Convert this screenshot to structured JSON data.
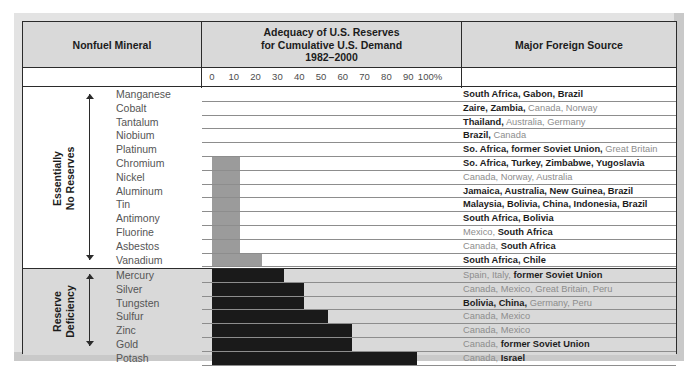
{
  "header": {
    "col_mineral": "Nonfuel Mineral",
    "col_adequacy_line1": "Adequacy of U.S. Reserves",
    "col_adequacy_line2": "for Cumulative U.S. Demand",
    "col_adequacy_line3": "1982–2000",
    "col_source": "Major Foreign Source"
  },
  "axis": {
    "ticks": [
      "0",
      "10",
      "20",
      "30",
      "40",
      "50",
      "60",
      "70",
      "80",
      "90",
      "100%"
    ],
    "values": [
      0,
      10,
      20,
      30,
      40,
      50,
      60,
      70,
      80,
      90,
      100
    ]
  },
  "groups": [
    {
      "label_line1": "Essentially",
      "label_line2": "No Reserves"
    },
    {
      "label_line1": "Reserve",
      "label_line2": "Deficiency"
    }
  ],
  "chart_data": {
    "type": "bar",
    "title": "Adequacy of U.S. Reserves for Cumulative U.S. Demand 1982–2000",
    "xlabel": "Adequacy of U.S. Reserves (percent of cumulative U.S. demand)",
    "ylabel": "Nonfuel Mineral",
    "xlim": [
      0,
      100
    ],
    "grid": true,
    "orientation": "horizontal",
    "legend": "none",
    "categories": [
      "Manganese",
      "Cobalt",
      "Tantalum",
      "Niobium",
      "Platinum",
      "Chromium",
      "Nickel",
      "Aluminum",
      "Tin",
      "Antimony",
      "Fluorine",
      "Asbestos",
      "Vanadium",
      "Mercury",
      "Silver",
      "Tungsten",
      "Sulfur",
      "Zinc",
      "Gold",
      "Potash"
    ],
    "values": [
      0,
      0,
      0,
      0,
      0,
      13,
      13,
      13,
      13,
      13,
      13,
      13,
      23,
      33,
      42,
      42,
      53,
      64,
      64,
      94
    ],
    "group_of": [
      "Essentially No Reserves",
      "Essentially No Reserves",
      "Essentially No Reserves",
      "Essentially No Reserves",
      "Essentially No Reserves",
      "Essentially No Reserves",
      "Essentially No Reserves",
      "Essentially No Reserves",
      "Essentially No Reserves",
      "Essentially No Reserves",
      "Essentially No Reserves",
      "Essentially No Reserves",
      "Essentially No Reserves",
      "Reserve Deficiency",
      "Reserve Deficiency",
      "Reserve Deficiency",
      "Reserve Deficiency",
      "Reserve Deficiency",
      "Reserve Deficiency",
      "Reserve Deficiency"
    ],
    "bar_colors": [
      "#9b9b9b",
      "#9b9b9b",
      "#9b9b9b",
      "#9b9b9b",
      "#9b9b9b",
      "#9b9b9b",
      "#9b9b9b",
      "#9b9b9b",
      "#9b9b9b",
      "#9b9b9b",
      "#9b9b9b",
      "#9b9b9b",
      "#9b9b9b",
      "#1a1a1a",
      "#1a1a1a",
      "#1a1a1a",
      "#1a1a1a",
      "#1a1a1a",
      "#1a1a1a",
      "#1a1a1a"
    ]
  },
  "rows": [
    {
      "mineral": "Manganese",
      "value": 0,
      "color": "gray",
      "source_html": "<b>South Africa, Gabon, Brazil</b>"
    },
    {
      "mineral": "Cobalt",
      "value": 0,
      "color": "gray",
      "source_html": "<b>Zaire, Zambia,</b> Canada, Norway"
    },
    {
      "mineral": "Tantalum",
      "value": 0,
      "color": "gray",
      "source_html": "<b>Thailand,</b> Australia, Germany"
    },
    {
      "mineral": "Niobium",
      "value": 0,
      "color": "gray",
      "source_html": "<b>Brazil,</b> Canada"
    },
    {
      "mineral": "Platinum",
      "value": 0,
      "color": "gray",
      "source_html": "<b>So. Africa, former Soviet Union,</b> Great Britain"
    },
    {
      "mineral": "Chromium",
      "value": 13,
      "color": "gray",
      "source_html": "<b>So. Africa, Turkey, Zimbabwe, Yugoslavia</b>"
    },
    {
      "mineral": "Nickel",
      "value": 13,
      "color": "gray",
      "source_html": "Canada, Norway, Australia"
    },
    {
      "mineral": "Aluminum",
      "value": 13,
      "color": "gray",
      "source_html": "<b>Jamaica, Australia, New Guinea, Brazil</b>"
    },
    {
      "mineral": "Tin",
      "value": 13,
      "color": "gray",
      "source_html": "<b>Malaysia, Bolivia, China, Indonesia, Brazil</b>"
    },
    {
      "mineral": "Antimony",
      "value": 13,
      "color": "gray",
      "source_html": "<b>South Africa, Bolivia</b>"
    },
    {
      "mineral": "Fluorine",
      "value": 13,
      "color": "gray",
      "source_html": "Mexico, <b>South Africa</b>"
    },
    {
      "mineral": "Asbestos",
      "value": 13,
      "color": "gray",
      "source_html": "Canada, <b>South Africa</b>"
    },
    {
      "mineral": "Vanadium",
      "value": 23,
      "color": "gray",
      "source_html": "<b>South Africa, Chile</b>"
    },
    {
      "mineral": "Mercury",
      "value": 33,
      "color": "black",
      "source_html": "Spain, Italy, <b>former Soviet Union</b>"
    },
    {
      "mineral": "Silver",
      "value": 42,
      "color": "black",
      "source_html": "Canada, Mexico, Great Britain, Peru"
    },
    {
      "mineral": "Tungsten",
      "value": 42,
      "color": "black",
      "source_html": "<b>Bolivia, China,</b> Germany, Peru"
    },
    {
      "mineral": "Sulfur",
      "value": 53,
      "color": "black",
      "source_html": "Canada, Mexico"
    },
    {
      "mineral": "Zinc",
      "value": 64,
      "color": "black",
      "source_html": "Canada, Mexico"
    },
    {
      "mineral": "Gold",
      "value": 64,
      "color": "black",
      "source_html": "Canada, <b>former Soviet Union</b>"
    },
    {
      "mineral": "Potash",
      "value": 94,
      "color": "black",
      "source_html": "Canada, <b>Israel</b>"
    }
  ],
  "colors": {
    "bar_gray": "#9b9b9b",
    "bar_black": "#1a1a1a",
    "header_fill": "#d9d9d9",
    "group_b_fill": "#d9d9d9",
    "border": "#2b2b2b"
  }
}
